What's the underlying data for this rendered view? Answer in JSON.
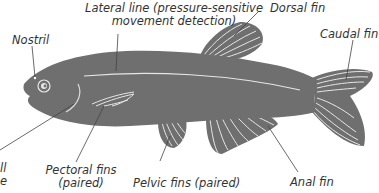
{
  "figure": {
    "colors": {
      "body": "#6f6f6f",
      "fin_rays": "#e6e6e6",
      "leader_line": "#444444",
      "label_text": "#333333",
      "background": "#ffffff"
    },
    "labels": {
      "lateral_line": {
        "line1": "Lateral line (pressure-sensitive",
        "line2": "movement detection)"
      },
      "nostril": "Nostril",
      "dorsal_fin": "Dorsal fin",
      "caudal_fin": "Caudal fin",
      "gill_clipped": {
        "line1": "ll",
        "line2": "e"
      },
      "pectoral_fins": {
        "line1": "Pectoral fins",
        "line2": "(paired)"
      },
      "pelvic_fins": "Pelvic fins (paired)",
      "anal_fin": "Anal fin"
    }
  }
}
